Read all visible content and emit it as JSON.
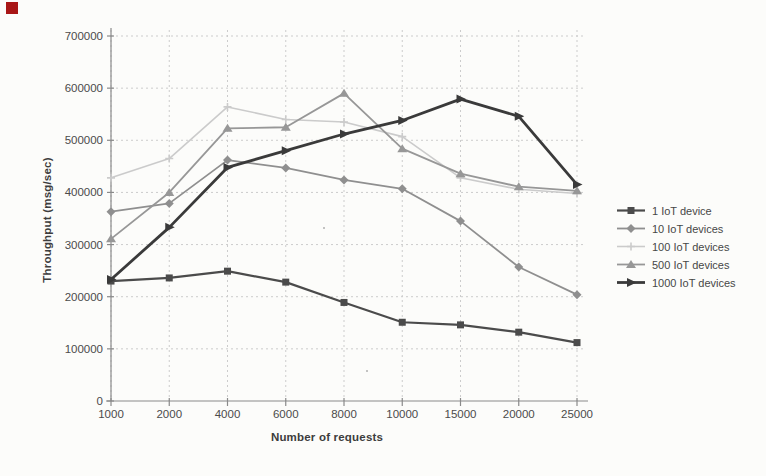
{
  "annotations": {
    "red_marker_color": "#a81616"
  },
  "chart_data": {
    "type": "line",
    "title": "",
    "xlabel": "Number of requests",
    "ylabel": "Throughput (msg/sec)",
    "x_tick_labels": [
      "1000",
      "2000",
      "4000",
      "6000",
      "8000",
      "10000",
      "15000",
      "20000",
      "25000"
    ],
    "y_tick_labels": [
      "0",
      "100000",
      "200000",
      "300000",
      "400000",
      "500000",
      "600000",
      "700000"
    ],
    "ylim": [
      0,
      700000
    ],
    "y_tick_step": 100000,
    "grid": {
      "horizontal": true,
      "vertical": true,
      "style": "dashed",
      "color": "#cccccc"
    },
    "axis_color": "#8a8a8a",
    "text_color": "#4b4b4b",
    "legend_position": "right",
    "categories": [
      1000,
      2000,
      4000,
      6000,
      8000,
      10000,
      15000,
      20000,
      25000
    ],
    "series": [
      {
        "name": "1 IoT device",
        "marker": "square",
        "color": "#4b4b4b",
        "stroke_width": 2.2,
        "values": [
          230000,
          236000,
          249000,
          228000,
          189000,
          151000,
          146000,
          132000,
          112000
        ]
      },
      {
        "name": "10 IoT devices",
        "marker": "diamond",
        "color": "#8f8f8f",
        "stroke_width": 1.8,
        "values": [
          363000,
          379000,
          462000,
          447000,
          424000,
          407000,
          345000,
          257000,
          204000
        ]
      },
      {
        "name": "100 IoT devices",
        "marker": "plus",
        "color": "#cbcbcb",
        "stroke_width": 1.6,
        "values": [
          428000,
          465000,
          564000,
          540000,
          535000,
          507000,
          428000,
          406000,
          398000
        ]
      },
      {
        "name": "500 IoT devices",
        "marker": "triangle",
        "color": "#979797",
        "stroke_width": 1.8,
        "values": [
          311000,
          400000,
          523000,
          525000,
          590000,
          484000,
          436000,
          411000,
          403000
        ]
      },
      {
        "name": "1000 IoT devices",
        "marker": "arrow-right",
        "color": "#3a3a3a",
        "stroke_width": 2.8,
        "values": [
          233000,
          333000,
          448000,
          480000,
          512000,
          538000,
          579000,
          546000,
          415000
        ]
      }
    ]
  }
}
